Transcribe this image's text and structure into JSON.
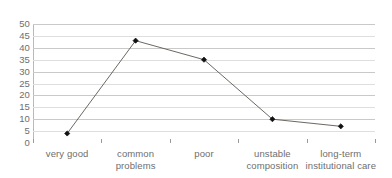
{
  "chart_data": {
    "type": "line",
    "title": "",
    "subtitle": "",
    "xlabel": "",
    "ylabel": "",
    "categories": [
      "very good",
      "common problems",
      "poor",
      "unstable composition",
      "long-term institutional care"
    ],
    "category_label_lines": [
      [
        "very good"
      ],
      [
        "common",
        "problems"
      ],
      [
        "poor"
      ],
      [
        "unstable",
        "composition"
      ],
      [
        "long-term",
        "institutional care"
      ]
    ],
    "values": [
      4,
      43,
      35,
      10,
      7
    ],
    "ylim": [
      0,
      50
    ],
    "ytick_step": 5,
    "yticks": [
      50,
      45,
      40,
      35,
      30,
      25,
      20,
      15,
      10,
      5,
      0
    ],
    "ytick_labels": [
      "50",
      "45",
      "40",
      "35",
      "30",
      "25",
      "20",
      "15",
      "10",
      "5",
      "0"
    ],
    "grid": true,
    "grid_orientation": "horizontal",
    "legend": false,
    "legend_position": "none",
    "markers": "diamond",
    "annotations": [],
    "colors": {
      "background": "#ffffff",
      "gridline": "#c9c9c9",
      "gridline_faint": "#dededf",
      "axis": "#8e8e8e",
      "series_line": "#5b564f",
      "marker": "#111111",
      "tick_text": "#6e6e6e"
    }
  }
}
